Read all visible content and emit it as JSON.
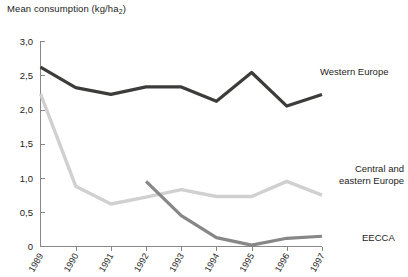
{
  "chart_data": {
    "type": "line",
    "title": "Mean consumption (kg/ha2)",
    "title_main": "Mean consumption (kg/ha",
    "title_sub": "2",
    "title_tail": ")",
    "xlabel": "",
    "ylabel": "Mean consumption (kg/ha2)",
    "x": [
      "1989",
      "1990",
      "1991",
      "1992",
      "1993",
      "1994",
      "1995",
      "1996",
      "1997"
    ],
    "categories": [
      "1989",
      "1990",
      "1991",
      "1992",
      "1993",
      "1994",
      "1995",
      "1996",
      "1997"
    ],
    "ytick_labels": [
      "0",
      "0,5",
      "1,0",
      "1,5",
      "2,0",
      "2,5",
      "3,0"
    ],
    "ytick_values": [
      0,
      0.5,
      1.0,
      1.5,
      2.0,
      2.5,
      3.0
    ],
    "ylim": [
      0,
      3.0
    ],
    "grid": false,
    "legend_position": "right-inline",
    "series": [
      {
        "name": "Western Europe",
        "color": "#3c3c3b",
        "x": [
          "1989",
          "1990",
          "1991",
          "1992",
          "1993",
          "1994",
          "1995",
          "1996",
          "1997"
        ],
        "values": [
          2.62,
          2.32,
          2.22,
          2.33,
          2.33,
          2.12,
          2.54,
          2.05,
          2.22
        ]
      },
      {
        "name": "Central and eastern Europe",
        "color": "#d0d0d0",
        "label_line1": "Central and",
        "label_line2": "eastern Europe",
        "x": [
          "1989",
          "1990",
          "1991",
          "1992",
          "1993",
          "1994",
          "1995",
          "1996",
          "1997"
        ],
        "values": [
          2.23,
          0.88,
          0.62,
          0.72,
          0.83,
          0.73,
          0.73,
          0.95,
          0.75
        ]
      },
      {
        "name": "EECCA",
        "color": "#878787",
        "x": [
          "1992",
          "1993",
          "1994",
          "1995",
          "1996",
          "1997"
        ],
        "values": [
          0.95,
          0.45,
          0.13,
          0.02,
          0.12,
          0.15
        ]
      }
    ],
    "annotations": [
      {
        "text": "Western Europe",
        "series": "Western Europe"
      },
      {
        "text": "Central and eastern Europe",
        "series": "Central and eastern Europe"
      },
      {
        "text": "EECCA",
        "series": "EECCA"
      }
    ]
  }
}
